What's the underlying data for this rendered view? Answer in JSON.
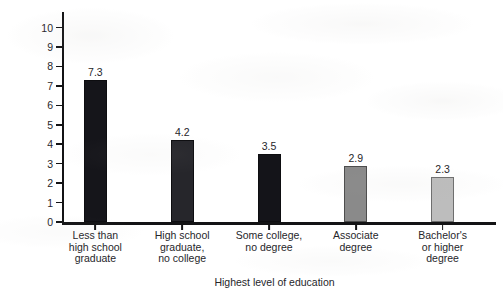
{
  "chart_data": {
    "type": "bar",
    "title": "",
    "xlabel": "Highest level of education",
    "ylabel": "Percent unemployed",
    "categories": [
      "Less than\nhigh school\ngraduate",
      "High school\ngraduate,\nno college",
      "Some college,\nno degree",
      "Associate\ndegree",
      "Bachelor's\nor higher\ndegree"
    ],
    "values": [
      7.3,
      4.2,
      3.5,
      2.9,
      2.3
    ],
    "value_labels": [
      "7.3",
      "4.2",
      "3.5",
      "2.9",
      "2.3"
    ],
    "bar_colors": [
      "#15151a",
      "#26262b",
      "#141419",
      "#8a8a8a",
      "#bdbdbd"
    ],
    "bar_edge_colors": [
      "#0d0d10",
      "#0d0d10",
      "#0d0d10",
      "#4d4d4d",
      "#6e6e6e"
    ],
    "ylim": [
      0,
      10.8
    ],
    "yticks": [
      0,
      1,
      2,
      3,
      4,
      5,
      6,
      7,
      8,
      9,
      10
    ],
    "ytick_labels": [
      "0",
      "1",
      "2",
      "3",
      "4",
      "5",
      "6",
      "7",
      "8",
      "9",
      "10"
    ],
    "grid": false,
    "legend": null
  },
  "axes": {
    "y_title": "Percent unemployed",
    "x_title": "Highest level of education"
  }
}
